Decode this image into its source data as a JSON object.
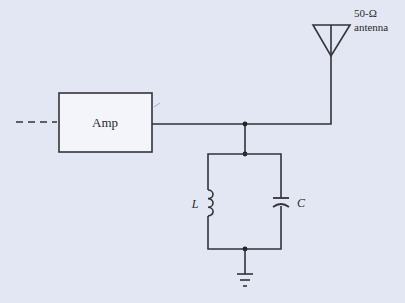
{
  "diagram": {
    "type": "circuit-schematic",
    "background": "#e3e6f3",
    "wire_color": "#333338",
    "components": {
      "amplifier": {
        "label": "Amp"
      },
      "antenna": {
        "label_line1": "50-Ω",
        "label_line2": "antenna"
      },
      "inductor": {
        "label": "L"
      },
      "capacitor": {
        "label": "C"
      },
      "ground": {
        "label": ""
      }
    },
    "connections": [
      "input (dashed) -> Amp",
      "Amp output -> junction -> antenna",
      "junction -> parallel LC tank",
      "LC tank bottom -> ground"
    ]
  }
}
